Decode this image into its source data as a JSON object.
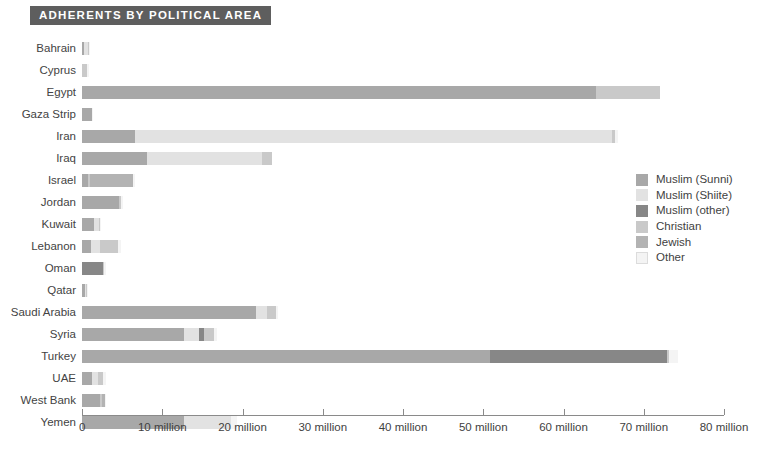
{
  "header": {
    "title": "ADHERENTS BY POLITICAL AREA"
  },
  "legend": {
    "position": "right-middle",
    "items": [
      {
        "label": "Muslim (Sunni)",
        "color": "#a8a8a8"
      },
      {
        "label": "Muslim (Shiite)",
        "color": "#e2e2e2"
      },
      {
        "label": "Muslim (other)",
        "color": "#878787"
      },
      {
        "label": "Christian",
        "color": "#c9c9c9"
      },
      {
        "label": "Jewish",
        "color": "#b3b3b3"
      },
      {
        "label": "Other",
        "color": "#f4f4f4"
      }
    ]
  },
  "chart_data": {
    "type": "bar",
    "orientation": "horizontal",
    "stacked": true,
    "title": "ADHERENTS BY POLITICAL AREA",
    "xlabel": "",
    "ylabel": "",
    "xlim": [
      0,
      80
    ],
    "units": "millions of adherents",
    "grid": false,
    "tick_values": [
      0,
      10,
      20,
      30,
      40,
      50,
      60,
      70,
      80
    ],
    "tick_labels": [
      "0",
      "10 million",
      "20 million",
      "30 million",
      "40  million",
      "50 million",
      "60 million",
      "70 million",
      "80 million"
    ],
    "categories": [
      "Bahrain",
      "Cyprus",
      "Egypt",
      "Gaza Strip",
      "Iran",
      "Iraq",
      "Israel",
      "Jordan",
      "Kuwait",
      "Lebanon",
      "Oman",
      "Qatar",
      "Saudi Arabia",
      "Syria",
      "Turkey",
      "UAE",
      "West Bank",
      "Yemen"
    ],
    "series": [
      {
        "name": "Muslim (Sunni)",
        "color": "#a8a8a8",
        "values": [
          0.3,
          0.0,
          64.0,
          1.2,
          6.6,
          8.1,
          0.8,
          4.6,
          1.5,
          1.1,
          0.0,
          0.35,
          21.7,
          12.7,
          50.9,
          1.3,
          2.3,
          12.7
        ]
      },
      {
        "name": "Muslim (Shiite)",
        "color": "#e2e2e2",
        "values": [
          0.45,
          0.0,
          0.0,
          0.0,
          59.5,
          14.3,
          0.0,
          0.0,
          0.6,
          1.2,
          0.0,
          0.05,
          1.3,
          1.9,
          0.0,
          0.7,
          0.0,
          5.9
        ]
      },
      {
        "name": "Muslim (other)",
        "color": "#878787",
        "values": [
          0.0,
          0.0,
          0.0,
          0.0,
          0.0,
          0.0,
          0.0,
          0.0,
          0.0,
          0.0,
          2.6,
          0.0,
          0.0,
          0.6,
          22.0,
          0.0,
          0.0,
          0.0
        ]
      },
      {
        "name": "Christian",
        "color": "#c9c9c9",
        "values": [
          0.1,
          0.65,
          8.0,
          0.0,
          0.3,
          1.3,
          0.2,
          0.3,
          0.15,
          2.2,
          0.1,
          0.1,
          1.2,
          1.3,
          0.2,
          0.6,
          0.15,
          0.0
        ]
      },
      {
        "name": "Jewish",
        "color": "#b3b3b3",
        "values": [
          0.0,
          0.0,
          0.0,
          0.0,
          0.0,
          0.0,
          5.4,
          0.0,
          0.0,
          0.0,
          0.0,
          0.0,
          0.0,
          0.0,
          0.0,
          0.0,
          0.4,
          0.0
        ]
      },
      {
        "name": "Other",
        "color": "#f4f4f4",
        "values": [
          0.1,
          0.2,
          0.0,
          0.1,
          0.4,
          0.0,
          0.1,
          0.1,
          0.1,
          0.4,
          0.2,
          0.05,
          0.2,
          0.3,
          1.2,
          0.4,
          0.1,
          0.7
        ]
      }
    ],
    "totals": [
      0.95,
      0.85,
      72.0,
      1.3,
      66.8,
      23.7,
      6.5,
      5.0,
      2.35,
      4.9,
      2.9,
      0.55,
      24.4,
      16.8,
      74.3,
      3.0,
      2.95,
      19.3
    ]
  }
}
